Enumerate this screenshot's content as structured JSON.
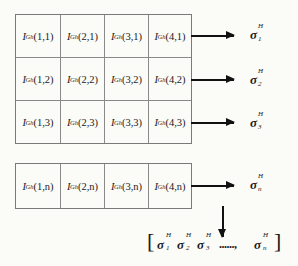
{
  "diagram": {
    "cell_symbol": "I",
    "cell_superscript": "Gh",
    "top_grid": {
      "rows": [
        {
          "cells": [
            "(1,1)",
            "(2,1)",
            "(3,1)",
            "(4,1)"
          ],
          "output": {
            "symbol": "σ",
            "superscript": "H",
            "subscript": "1"
          }
        },
        {
          "cells": [
            "(1,2)",
            "(2,2)",
            "(3,2)",
            "(4,2)"
          ],
          "output": {
            "symbol": "σ",
            "superscript": "H",
            "subscript": "2"
          }
        },
        {
          "cells": [
            "(1,3)",
            "(2,3)",
            "(3,3)",
            "(4,3)"
          ],
          "output": {
            "symbol": "σ",
            "superscript": "H",
            "subscript": "3"
          }
        }
      ]
    },
    "bottom_grid": {
      "rows": [
        {
          "cells": [
            "(1,n)",
            "(2,n)",
            "(3,n)",
            "(4,n)"
          ],
          "output": {
            "symbol": "σ",
            "superscript": "H",
            "subscript": "n"
          }
        }
      ]
    },
    "result_vector": {
      "open_bracket": "[",
      "close_bracket": "]",
      "items": [
        {
          "symbol": "σ",
          "superscript": "H",
          "subscript": "1"
        },
        {
          "symbol": "σ",
          "superscript": "H",
          "subscript": "2"
        },
        {
          "symbol": "σ",
          "superscript": "H",
          "subscript": "3"
        },
        {
          "symbol": "σ",
          "superscript": "H",
          "subscript": "n"
        }
      ],
      "ellipsis": "......,"
    },
    "colors": {
      "grid_line": "#7a7a7a",
      "arrow": "#111111",
      "background": "#fbfbf8"
    }
  }
}
